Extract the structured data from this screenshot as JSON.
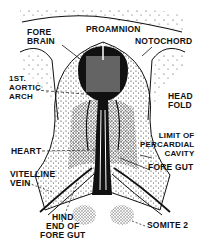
{
  "diagram": {
    "labels": {
      "proamnion": "PROAMNION",
      "fore_brain": "FORE\nBRAIN",
      "notochord": "NOTOCHORD",
      "aortic_arch": "1ST.\nAORTIC\nARCH",
      "head_fold": "HEAD\nFOLD",
      "pericardial": "LIMIT OF\nPERCARDIAL\nCAVITY",
      "heart": "HEART",
      "fore_gut": "FORE GUT",
      "vitelline_vein": "VITELLINE\nVEIN",
      "hind_end": "HIND\nEND OF\nFORE GUT",
      "somite": "SOMITE 2"
    },
    "colors": {
      "ink": "#111111",
      "background": "#ffffff"
    }
  }
}
